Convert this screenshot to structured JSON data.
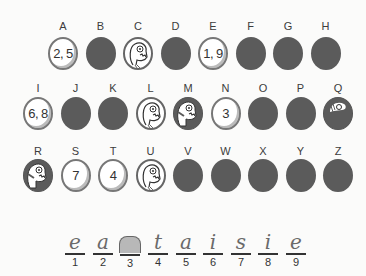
{
  "puzzle": {
    "row1": [
      {
        "letter": "A",
        "state": "revealed",
        "content": "2, 5"
      },
      {
        "letter": "B",
        "state": "hidden",
        "content": ""
      },
      {
        "letter": "C",
        "state": "face",
        "content": ""
      },
      {
        "letter": "D",
        "state": "hidden",
        "content": ""
      },
      {
        "letter": "E",
        "state": "revealed",
        "content": "1, 9"
      },
      {
        "letter": "F",
        "state": "hidden",
        "content": ""
      },
      {
        "letter": "G",
        "state": "hidden",
        "content": ""
      },
      {
        "letter": "H",
        "state": "hidden",
        "content": ""
      }
    ],
    "row2": [
      {
        "letter": "I",
        "state": "revealed",
        "content": "6, 8"
      },
      {
        "letter": "J",
        "state": "hidden",
        "content": ""
      },
      {
        "letter": "K",
        "state": "hidden",
        "content": ""
      },
      {
        "letter": "L",
        "state": "face",
        "content": ""
      },
      {
        "letter": "M",
        "state": "face-partial",
        "content": ""
      },
      {
        "letter": "N",
        "state": "revealed",
        "content": "3"
      },
      {
        "letter": "O",
        "state": "hidden",
        "content": ""
      },
      {
        "letter": "P",
        "state": "hidden",
        "content": ""
      },
      {
        "letter": "Q",
        "state": "face-partial-dark",
        "content": ""
      }
    ],
    "row3": [
      {
        "letter": "R",
        "state": "face-partial",
        "content": ""
      },
      {
        "letter": "S",
        "state": "revealed",
        "content": "7"
      },
      {
        "letter": "T",
        "state": "revealed",
        "content": "4"
      },
      {
        "letter": "U",
        "state": "face",
        "content": ""
      },
      {
        "letter": "V",
        "state": "hidden",
        "content": ""
      },
      {
        "letter": "W",
        "state": "hidden",
        "content": ""
      },
      {
        "letter": "X",
        "state": "hidden",
        "content": ""
      },
      {
        "letter": "Y",
        "state": "hidden",
        "content": ""
      },
      {
        "letter": "Z",
        "state": "hidden",
        "content": ""
      }
    ]
  },
  "answer": {
    "blanks": [
      {
        "index": "1",
        "char": "e"
      },
      {
        "index": "2",
        "char": "a"
      },
      {
        "index": "3",
        "char": "n"
      },
      {
        "index": "4",
        "char": "t"
      },
      {
        "index": "5",
        "char": "a"
      },
      {
        "index": "6",
        "char": "i"
      },
      {
        "index": "7",
        "char": "s"
      },
      {
        "index": "8",
        "char": "i"
      },
      {
        "index": "9",
        "char": "e"
      }
    ]
  },
  "colors": {
    "hidden_coin": "#5b5b5b",
    "revealed_coin": "#ffffff",
    "background": "#fbfbfa"
  }
}
